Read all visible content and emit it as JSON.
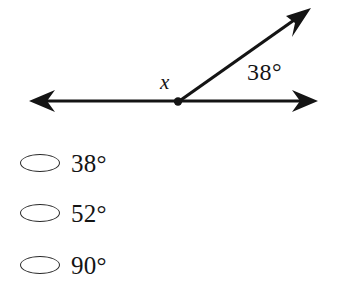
{
  "figure": {
    "name": "angle-diagram",
    "background_color": "#ffffff",
    "stroke_color": "#141414",
    "vertex_label": "x",
    "angle_label": "38°",
    "geometry": {
      "vertex": [
        178,
        102
      ],
      "line_left_tip": [
        29,
        101
      ],
      "line_right_tip": [
        318,
        101
      ],
      "ray_tip": [
        311,
        8
      ],
      "ray_angle_degrees": 38,
      "stroke_width": 3
    }
  },
  "choices": {
    "name": "answer-options",
    "items": [
      {
        "label": "38°",
        "selected": false
      },
      {
        "label": "52°",
        "selected": false
      },
      {
        "label": "90°",
        "selected": false
      }
    ]
  }
}
